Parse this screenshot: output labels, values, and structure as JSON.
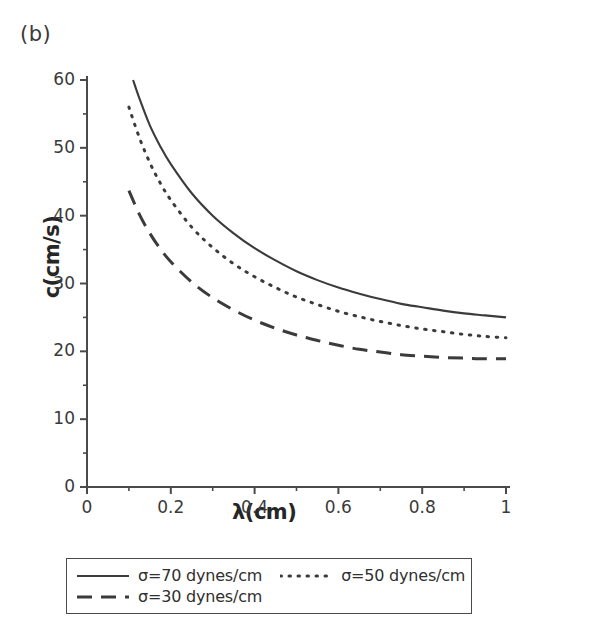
{
  "panel": {
    "label": "(b)"
  },
  "chart_data": {
    "type": "line",
    "title": "",
    "subtitle": "",
    "xlabel": "λ(cm)",
    "ylabel": "c(cm/s)",
    "xlim": [
      0,
      1
    ],
    "ylim": [
      0,
      60
    ],
    "grid": false,
    "legend_position": "below-plot",
    "x_major_ticks": [
      "0",
      "0.2",
      "0.4",
      "0.6",
      "0.8",
      "1"
    ],
    "x_major_values": [
      0,
      0.2,
      0.4,
      0.6,
      0.8,
      1
    ],
    "x_minor_values": [
      0.1,
      0.3,
      0.5,
      0.7,
      0.9
    ],
    "y_major_ticks": [
      "0",
      "10",
      "20",
      "30",
      "40",
      "50",
      "60"
    ],
    "y_major_values": [
      0,
      10,
      20,
      30,
      40,
      50,
      60
    ],
    "y_minor_values": [
      5,
      15,
      25,
      35,
      45,
      55
    ],
    "series": [
      {
        "name": "σ=70 dynes/cm",
        "style": "solid",
        "color": "#3b3b3b",
        "x": [
          0.11,
          0.125,
          0.15,
          0.175,
          0.2,
          0.25,
          0.3,
          0.35,
          0.4,
          0.45,
          0.5,
          0.55,
          0.6,
          0.65,
          0.7,
          0.75,
          0.8,
          0.85,
          0.9,
          0.95,
          1.0
        ],
        "values": [
          60.0,
          57.3,
          53.3,
          50.2,
          47.6,
          43.3,
          40.0,
          37.4,
          35.2,
          33.4,
          31.8,
          30.5,
          29.4,
          28.5,
          27.7,
          27.0,
          26.5,
          26.0,
          25.6,
          25.3,
          25.0
        ]
      },
      {
        "name": "σ=50 dynes/cm",
        "style": "dotted",
        "color": "#3b3b3b",
        "x": [
          0.1,
          0.125,
          0.15,
          0.175,
          0.2,
          0.25,
          0.3,
          0.35,
          0.4,
          0.45,
          0.5,
          0.55,
          0.6,
          0.65,
          0.7,
          0.75,
          0.8,
          0.85,
          0.9,
          0.95,
          1.0
        ],
        "values": [
          56.0,
          51.5,
          47.8,
          44.8,
          42.3,
          38.3,
          35.3,
          32.9,
          31.0,
          29.4,
          28.0,
          26.9,
          25.9,
          25.1,
          24.4,
          23.8,
          23.3,
          22.9,
          22.5,
          22.2,
          22.0
        ]
      },
      {
        "name": "σ=30 dynes/cm",
        "style": "dashed",
        "color": "#3b3b3b",
        "x": [
          0.1,
          0.125,
          0.15,
          0.175,
          0.2,
          0.25,
          0.3,
          0.35,
          0.4,
          0.45,
          0.5,
          0.55,
          0.6,
          0.65,
          0.7,
          0.75,
          0.8,
          0.85,
          0.9,
          0.95,
          1.0
        ],
        "values": [
          43.7,
          40.2,
          37.4,
          35.1,
          33.2,
          30.2,
          27.9,
          26.1,
          24.6,
          23.4,
          22.4,
          21.6,
          20.9,
          20.3,
          19.9,
          19.5,
          19.3,
          19.1,
          19.0,
          18.9,
          18.9
        ]
      }
    ]
  },
  "legend": {
    "rows": [
      [
        {
          "sample": "solid-line-sample",
          "label": "σ=70 dynes/cm"
        },
        {
          "sample": "dotted-line-sample",
          "label": "σ=50 dynes/cm"
        }
      ],
      [
        {
          "sample": "dashed-line-sample",
          "label": "σ=30 dynes/cm"
        }
      ]
    ]
  }
}
